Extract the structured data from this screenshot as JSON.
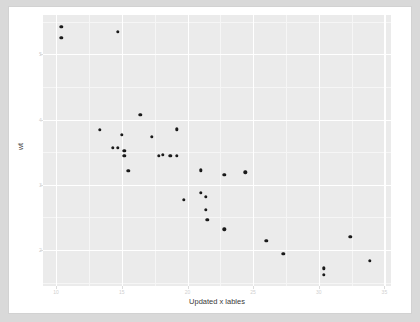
{
  "figure": {
    "background_color": "#ffffff",
    "panel_color": "#ebebeb",
    "grid_color": "#ffffff",
    "point_color": "#1a1a1a"
  },
  "chart_data": {
    "type": "scatter",
    "title": "",
    "xlabel": "Updated x lables",
    "ylabel": "wt",
    "xlim": [
      9.0,
      35.5
    ],
    "ylim": [
      1.45,
      5.6
    ],
    "xticks": [
      10,
      15,
      20,
      25,
      30,
      35
    ],
    "yticks": [
      5,
      4,
      3,
      2
    ],
    "xticklabels": [
      "10",
      "15",
      "20",
      "25",
      "30",
      "35"
    ],
    "yticklabels": [
      "5",
      "4",
      "3",
      "2"
    ],
    "grid": true,
    "legend": "none",
    "series": [
      {
        "name": "cars",
        "points": [
          {
            "x": 10.4,
            "y": 5.42
          },
          {
            "x": 10.4,
            "y": 5.25
          },
          {
            "x": 14.7,
            "y": 5.34
          },
          {
            "x": 16.4,
            "y": 4.07
          },
          {
            "x": 13.3,
            "y": 3.84
          },
          {
            "x": 19.2,
            "y": 3.85
          },
          {
            "x": 15.0,
            "y": 3.77
          },
          {
            "x": 17.3,
            "y": 3.73
          },
          {
            "x": 14.3,
            "y": 3.57
          },
          {
            "x": 14.7,
            "y": 3.57
          },
          {
            "x": 15.2,
            "y": 3.52
          },
          {
            "x": 15.2,
            "y": 3.44
          },
          {
            "x": 17.8,
            "y": 3.44
          },
          {
            "x": 18.1,
            "y": 3.46
          },
          {
            "x": 18.7,
            "y": 3.44
          },
          {
            "x": 19.2,
            "y": 3.44
          },
          {
            "x": 15.5,
            "y": 3.21
          },
          {
            "x": 21.0,
            "y": 3.22
          },
          {
            "x": 22.8,
            "y": 3.15
          },
          {
            "x": 24.4,
            "y": 3.19
          },
          {
            "x": 19.7,
            "y": 2.77
          },
          {
            "x": 21.0,
            "y": 2.88
          },
          {
            "x": 21.4,
            "y": 2.82
          },
          {
            "x": 21.4,
            "y": 2.62
          },
          {
            "x": 21.5,
            "y": 2.46
          },
          {
            "x": 22.8,
            "y": 2.32
          },
          {
            "x": 26.0,
            "y": 2.14
          },
          {
            "x": 27.3,
            "y": 1.94
          },
          {
            "x": 30.4,
            "y": 1.72
          },
          {
            "x": 30.4,
            "y": 1.62
          },
          {
            "x": 32.4,
            "y": 2.2
          },
          {
            "x": 33.9,
            "y": 1.84
          }
        ]
      }
    ]
  }
}
